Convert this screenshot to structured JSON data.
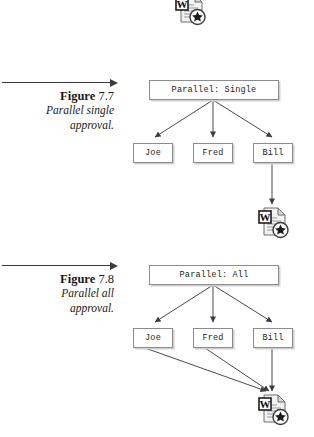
{
  "document": {
    "background_color": "#ffffff",
    "line_color": "#4a4a4a",
    "box_border_color": "#8c8c8c",
    "box_shadow_color": "#cfcfcf"
  },
  "figures": [
    {
      "id": "figure-7-7",
      "label_word": "Figure",
      "label_number": "7.7",
      "description_line_1": "Parallel single",
      "description_line_2": "approval.",
      "diagram": {
        "root": {
          "label": "Parallel: Single"
        },
        "approvers": [
          {
            "label": "Joe"
          },
          {
            "label": "Fred"
          },
          {
            "label": "Bill"
          }
        ],
        "output": {
          "icon": "word-document-icon",
          "badge": "W",
          "overlay": "star-circle-icon"
        },
        "connections": [
          {
            "from": "Parallel: Single",
            "to": "Joe",
            "arrow": true
          },
          {
            "from": "Parallel: Single",
            "to": "Fred",
            "arrow": true
          },
          {
            "from": "Parallel: Single",
            "to": "Bill",
            "arrow": true
          },
          {
            "from": "Bill",
            "to": "word-document-icon",
            "arrow": true
          }
        ]
      }
    },
    {
      "id": "figure-7-8",
      "label_word": "Figure",
      "label_number": "7.8",
      "description_line_1": "Parallel all",
      "description_line_2": "approval.",
      "diagram": {
        "root": {
          "label": "Parallel: All"
        },
        "approvers": [
          {
            "label": "Joe"
          },
          {
            "label": "Fred"
          },
          {
            "label": "Bill"
          }
        ],
        "output": {
          "icon": "word-document-icon",
          "badge": "W",
          "overlay": "star-circle-icon"
        },
        "connections": [
          {
            "from": "Parallel: All",
            "to": "Joe",
            "arrow": true
          },
          {
            "from": "Parallel: All",
            "to": "Fred",
            "arrow": true
          },
          {
            "from": "Parallel: All",
            "to": "Bill",
            "arrow": true
          },
          {
            "from": "Joe",
            "to": "word-document-icon",
            "arrow": true
          },
          {
            "from": "Fred",
            "to": "word-document-icon",
            "arrow": true
          },
          {
            "from": "Bill",
            "to": "word-document-icon",
            "arrow": true
          }
        ]
      }
    }
  ],
  "top_icon": {
    "icon": "word-document-icon",
    "badge": "W",
    "overlay": "star-circle-icon",
    "clipped": true
  }
}
